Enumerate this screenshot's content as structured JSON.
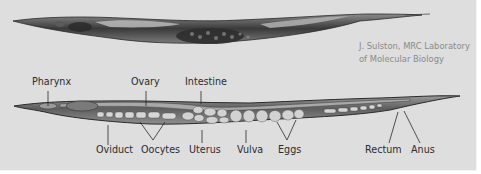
{
  "figure": {
    "credit_line1": "J. Sulston, MRC Laboratory",
    "credit_line2": "of Molecular Biology",
    "top_labels": [
      {
        "text": "Pharynx",
        "x": 32,
        "y": 81
      },
      {
        "text": "Ovary",
        "x": 128,
        "y": 81
      },
      {
        "text": "Intestine",
        "x": 184,
        "y": 81
      }
    ],
    "bottom_labels": [
      {
        "text": "Oviduct",
        "x": 96,
        "y": 143
      },
      {
        "text": "Oocytes",
        "x": 141,
        "y": 143
      },
      {
        "text": "Uterus",
        "x": 189,
        "y": 143
      },
      {
        "text": "Vulva",
        "x": 237,
        "y": 143
      },
      {
        "text": "Eggs",
        "x": 279,
        "y": 143
      },
      {
        "text": "Rectum",
        "x": 364,
        "y": 143
      },
      {
        "text": "Anus",
        "x": 411,
        "y": 143
      }
    ],
    "colors": {
      "background": "#dedede",
      "label_text": "#2c2c2c",
      "credit_text": "#8a8a8a",
      "worm_dark": "#2a2a2a",
      "worm_mid": "#6d6d6d",
      "egg_fill": "#cfcfcf"
    }
  }
}
